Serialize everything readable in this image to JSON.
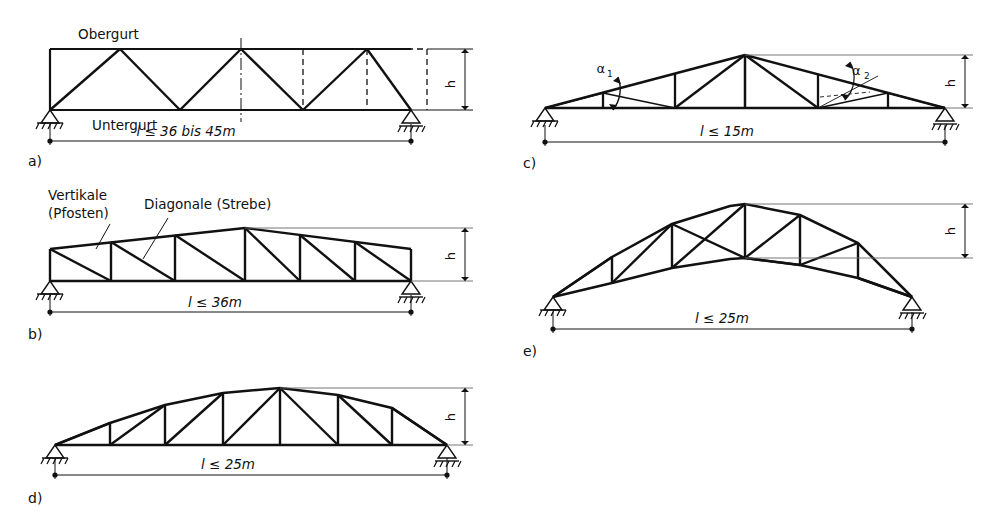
{
  "figure": {
    "stroke_color": "#111111",
    "thin_color": "#555555",
    "background": "#ffffff"
  },
  "labels": {
    "obergurt": "Obergurt",
    "untergurt": "Untergurt",
    "vertikale_line1": "Vertikale",
    "vertikale_line2": "(Pfosten)",
    "diagonale": "Diagonale (Strebe)",
    "height_symbol": "h",
    "alpha1": "α",
    "alpha1_sub": "1",
    "alpha2": "α",
    "alpha2_sub": "2"
  },
  "panels": [
    {
      "key": "a",
      "caption": "a)",
      "span_label": "l ≤ 36 bis 45m",
      "span_italic_l": "l",
      "span_rest": "≤ 36 bis 45m",
      "height_label": "h",
      "type": "parallel-chord-warren",
      "notes": "Parallelgurtbinder mit Diagonalen und gestrichelten Pfosten"
    },
    {
      "key": "b",
      "caption": "b)",
      "span_label": "l ≤ 36m",
      "span_italic_l": "l",
      "span_rest": "≤ 36m",
      "height_label": "h",
      "type": "trapezoidal-pratt",
      "notes": "Trapezbinder mit Vertikalen (Pfosten) und Diagonalen (Streben)"
    },
    {
      "key": "c",
      "caption": "c)",
      "span_label": "l ≤ 15m",
      "span_italic_l": "l",
      "span_rest": "≤ 15m",
      "height_label": "h",
      "type": "pitched-roof-truss",
      "notes": "Satteldachbinder mit Winkeln alpha1 und alpha2"
    },
    {
      "key": "d",
      "caption": "d)",
      "span_label": "l ≤ 25m",
      "span_italic_l": "l",
      "span_rest": "≤ 25m",
      "height_label": "h",
      "type": "bowstring-truss",
      "notes": "Bogenbinder mit geradem Untergurt"
    },
    {
      "key": "e",
      "caption": "e)",
      "span_label": "l ≤ 25m",
      "span_italic_l": "l",
      "span_rest": "≤ 25m",
      "height_label": "h",
      "type": "lenticular-arched-truss",
      "notes": "Linsenförmiger Bogenbinder, beide Gurte gekrümmt"
    }
  ]
}
